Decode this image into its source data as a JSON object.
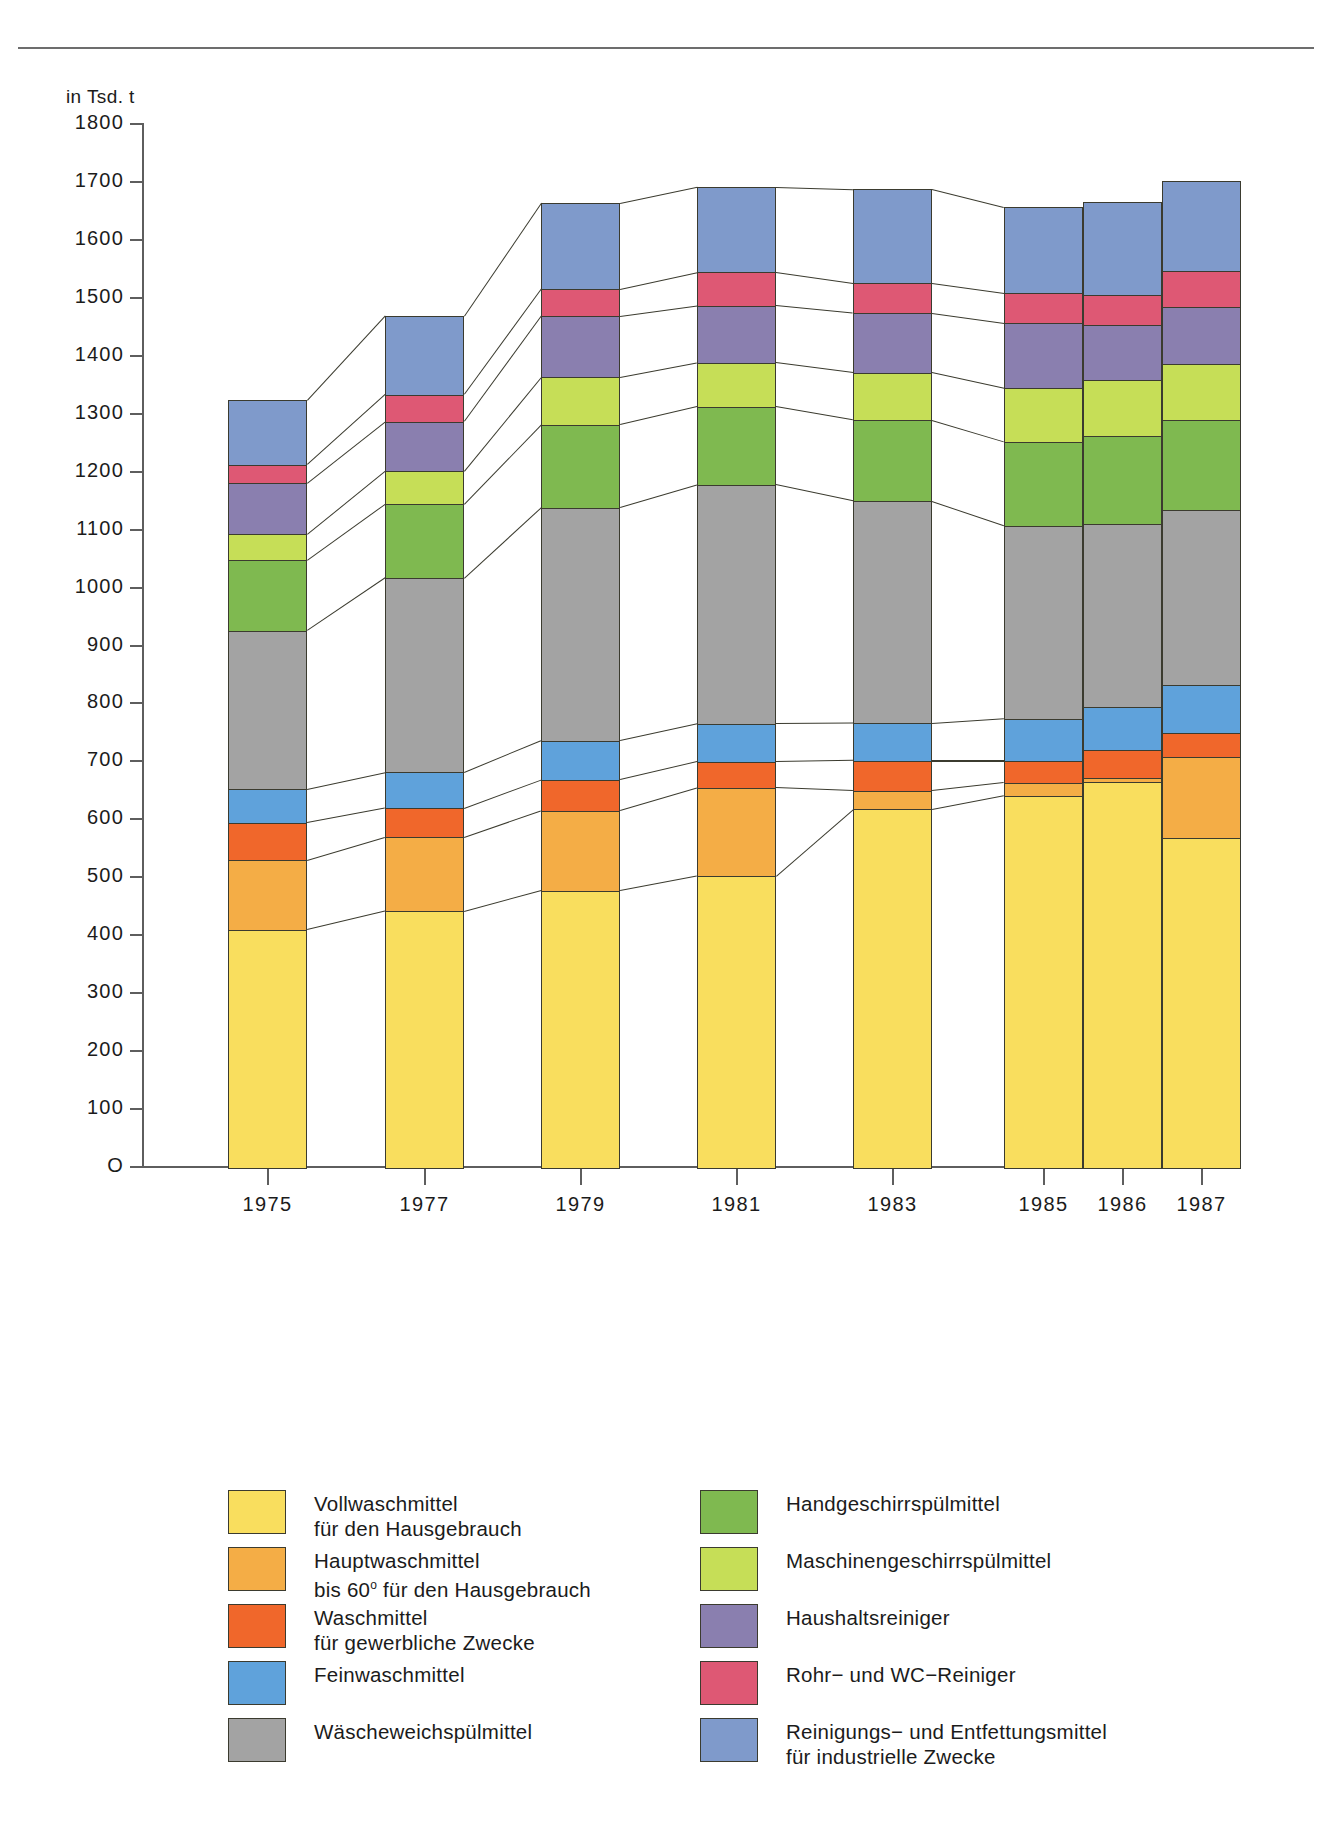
{
  "chart_data": {
    "type": "bar",
    "subtype": "stacked-bar",
    "title": "",
    "axis_unit_label": "in Tsd. t",
    "xlabel": "",
    "ylabel": "in Tsd. t",
    "ylim": [
      0,
      1800
    ],
    "ytick_step": 100,
    "yticks": [
      "1800",
      "1700",
      "1600",
      "1500",
      "1400",
      "1300",
      "1200",
      "1100",
      "1000",
      "900",
      "800",
      "700",
      "600",
      "500",
      "400",
      "300",
      "200",
      "100",
      "0"
    ],
    "grid": false,
    "legend_position": "bottom",
    "categories": [
      "1975",
      "1977",
      "1979",
      "1981",
      "1983",
      "1985",
      "1986",
      "1987"
    ],
    "series": [
      {
        "name": "Vollwaschmittel für den Hausgebrauch",
        "color": "#F9DE5E",
        "values": [
          410,
          442,
          478,
          503,
          618,
          642,
          665,
          568
        ]
      },
      {
        "name": "Hauptwaschmittel bis 60° für den Hausgebrauch",
        "color": "#F4AD46",
        "values": [
          120,
          128,
          138,
          152,
          32,
          22,
          8,
          140
        ]
      },
      {
        "name": "Waschmittel für gewerbliche Zwecke",
        "color": "#F0672B",
        "values": [
          65,
          50,
          53,
          45,
          52,
          38,
          47,
          42
        ]
      },
      {
        "name": "Feinwaschmittel",
        "color": "#5FA2DB",
        "values": [
          58,
          62,
          68,
          66,
          65,
          73,
          75,
          82
        ]
      },
      {
        "name": "Wäscheweichspülmittel",
        "color": "#A3A3A3",
        "values": [
          273,
          335,
          402,
          412,
          383,
          333,
          315,
          303
        ]
      },
      {
        "name": "Handgeschirrspülmittel",
        "color": "#7FB950",
        "values": [
          122,
          128,
          143,
          135,
          140,
          145,
          152,
          155
        ]
      },
      {
        "name": "Maschinengeschirrspülmittel",
        "color": "#C6DE57",
        "values": [
          45,
          57,
          82,
          76,
          82,
          92,
          97,
          97
        ]
      },
      {
        "name": "Haushaltsreiniger",
        "color": "#8A7FAF",
        "values": [
          88,
          85,
          105,
          98,
          102,
          112,
          95,
          98
        ]
      },
      {
        "name": "Rohr- und WC-Reiniger",
        "color": "#DE5874",
        "values": [
          32,
          47,
          47,
          58,
          52,
          52,
          52,
          62
        ]
      },
      {
        "name": "Reinigungs- und Entfettungsmittel für industrielle Zwecke",
        "color": "#7F9ACB",
        "values": [
          110,
          135,
          148,
          147,
          162,
          148,
          160,
          155
        ]
      }
    ],
    "totals": [
      1320,
      1468,
      1697,
      1715,
      1702,
      1660,
      1665,
      1700
    ]
  },
  "legend": {
    "left": [
      {
        "color": "#F9DE5E",
        "label": "Vollwaschmittel\nfür den Hausgebrauch"
      },
      {
        "color": "#F4AD46",
        "label": "Hauptwaschmittel\nbis 60° für den Hausgebrauch"
      },
      {
        "color": "#F0672B",
        "label": "Waschmittel\nfür gewerbliche Zwecke"
      },
      {
        "color": "#5FA2DB",
        "label": "Feinwaschmittel"
      },
      {
        "color": "#A3A3A3",
        "label": "Wäscheweichspülmittel"
      }
    ],
    "right": [
      {
        "color": "#7FB950",
        "label": "Handgeschirrspülmittel"
      },
      {
        "color": "#C6DE57",
        "label": "Maschinengeschirrspülmittel"
      },
      {
        "color": "#8A7FAF",
        "label": "Haushaltsreiniger"
      },
      {
        "color": "#DE5874",
        "label": "Rohr− und WC−Reiniger"
      },
      {
        "color": "#7F9ACB",
        "label": "Reinigungs− und Entfettungsmittel\nfür industrielle Zwecke"
      }
    ]
  }
}
